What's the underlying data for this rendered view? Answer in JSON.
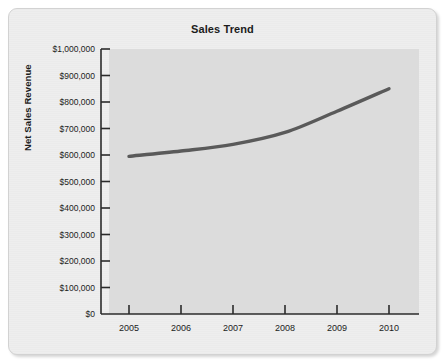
{
  "card": {
    "background_color": "#eeeeee",
    "border_color": "#d2d2d2"
  },
  "chart_data": {
    "type": "line",
    "title": "Sales Trend",
    "xlabel": "",
    "ylabel": "Net Sales Revenue",
    "categories": [
      "2005",
      "2006",
      "2007",
      "2008",
      "2009",
      "2010"
    ],
    "values": [
      595000,
      615000,
      640000,
      685000,
      765000,
      850000
    ],
    "x_tick_labels": [
      "2005",
      "2006",
      "2007",
      "2008",
      "2009",
      "2010"
    ],
    "y_tick_labels": [
      "$1,000,000",
      "$900,000",
      "$800,000",
      "$700,000",
      "$600,000",
      "$500,000",
      "$400,000",
      "$300,000",
      "$200,000",
      "$100,000",
      "$0"
    ],
    "y_tick_values": [
      1000000,
      900000,
      800000,
      700000,
      600000,
      500000,
      400000,
      300000,
      200000,
      100000,
      0
    ],
    "ylim": [
      0,
      1000000
    ],
    "grid": false,
    "legend": false,
    "series_color": "#5a5a5a",
    "plot_background_color": "#dcdcdc",
    "axis_color": "#2b2b2b"
  }
}
